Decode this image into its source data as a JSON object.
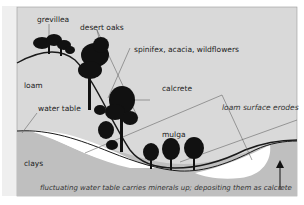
{
  "diagram": {
    "labels": {
      "grevillea": "grevillea",
      "desert_oaks": "desert oaks",
      "spinifex": "spinifex, acacia, wildflowers",
      "loam": "loam",
      "calcrete": "calcrete",
      "water_table": "water table",
      "loam_erodes": "loam surface erodes",
      "mulga": "mulga",
      "clays": "clays",
      "caption": "fluctuating water table carries minerals up; depositing them as calcrete"
    },
    "colors": {
      "sky": "#d9d9d9",
      "clay": "#bfbfbf",
      "calcrete": "#ffffff",
      "tree": "#111111",
      "line": "#555555",
      "margin": "#efefef"
    }
  }
}
